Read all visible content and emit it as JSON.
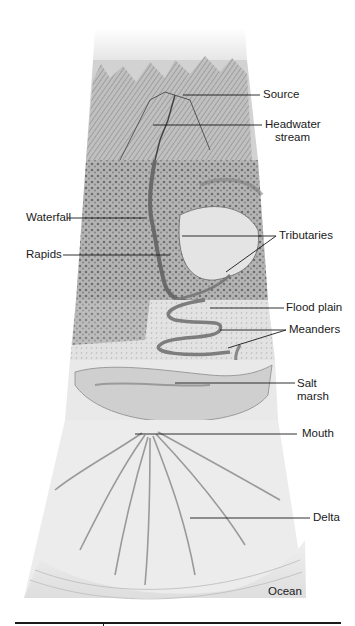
{
  "diagram": {
    "title": "",
    "labels": [
      {
        "id": "source",
        "text": "Source"
      },
      {
        "id": "headwater",
        "line1": "Headwater",
        "line2": "stream"
      },
      {
        "id": "waterfall",
        "text": "Waterfall"
      },
      {
        "id": "rapids",
        "text": "Rapids"
      },
      {
        "id": "tributaries",
        "text": "Tributaries"
      },
      {
        "id": "floodplain",
        "text": "Flood plain"
      },
      {
        "id": "meanders",
        "text": "Meanders"
      },
      {
        "id": "saltmarsh",
        "line1": "Salt",
        "line2": "marsh"
      },
      {
        "id": "mouth",
        "text": "Mouth"
      },
      {
        "id": "delta",
        "text": "Delta"
      },
      {
        "id": "ocean",
        "text": "Ocean"
      }
    ],
    "colors": {
      "ink": "#1a1a1a",
      "paper": "#ffffff",
      "shade_light": "#d9d9d9",
      "shade_mid": "#a8a8a8",
      "shade_dark": "#5a5a5a",
      "ocean": "#e4e4e4"
    }
  }
}
